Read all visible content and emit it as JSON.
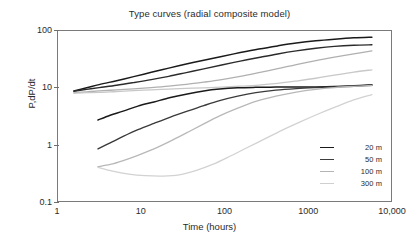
{
  "chart_data": {
    "type": "line",
    "title": "Type curves (radial composite model)",
    "xlabel": "Time (hours)",
    "ylabel": "P,dP/dt",
    "xscale": "log",
    "yscale": "log",
    "xlim": [
      1,
      10000
    ],
    "ylim": [
      0.1,
      100
    ],
    "grid": false,
    "legend_position": "lower-right",
    "xticks": [
      1,
      10,
      100,
      1000,
      10000
    ],
    "xtick_labels": [
      "1",
      "10",
      "100",
      "1000",
      "10,000"
    ],
    "yticks": [
      0.1,
      1,
      10,
      100
    ],
    "ytick_labels": [
      "0.1",
      "1",
      "10",
      "100"
    ],
    "legend": [
      {
        "label": "20 m",
        "color": "#1a1a1a"
      },
      {
        "label": "50 m",
        "color": "#3d3d3d"
      },
      {
        "label": "100 m",
        "color": "#b4b4b4"
      },
      {
        "label": "300 m",
        "color": "#cfcfcf"
      }
    ],
    "series": [
      {
        "name": "20 m pressure",
        "legend_group": "20 m",
        "color": "#1a1a1a",
        "width": 1.5,
        "points": [
          [
            1.55,
            9.0
          ],
          [
            2.2,
            10.2
          ],
          [
            3.1,
            11.6
          ],
          [
            5.0,
            13.6
          ],
          [
            8.0,
            16.0
          ],
          [
            13.0,
            19.0
          ],
          [
            21.0,
            22.5
          ],
          [
            34.0,
            26.5
          ],
          [
            55.0,
            31.0
          ],
          [
            90.0,
            36.0
          ],
          [
            150.0,
            42.0
          ],
          [
            250.0,
            48.5
          ],
          [
            420.0,
            55.0
          ],
          [
            700.0,
            61.5
          ],
          [
            1200.0,
            67.5
          ],
          [
            2000.0,
            72.0
          ],
          [
            3400.0,
            76.0
          ],
          [
            5600.0,
            78.0
          ]
        ]
      },
      {
        "name": "50 m pressure",
        "legend_group": "50 m",
        "color": "#2b2b2b",
        "width": 1.4,
        "points": [
          [
            1.55,
            8.9
          ],
          [
            2.2,
            9.6
          ],
          [
            3.1,
            10.3
          ],
          [
            5.0,
            11.3
          ],
          [
            8.0,
            12.6
          ],
          [
            13.0,
            14.2
          ],
          [
            21.0,
            16.2
          ],
          [
            34.0,
            18.8
          ],
          [
            55.0,
            21.8
          ],
          [
            90.0,
            25.5
          ],
          [
            150.0,
            29.8
          ],
          [
            250.0,
            34.5
          ],
          [
            420.0,
            39.8
          ],
          [
            700.0,
            45.0
          ],
          [
            1200.0,
            50.0
          ],
          [
            2000.0,
            54.0
          ],
          [
            3400.0,
            56.5
          ],
          [
            5600.0,
            57.5
          ]
        ]
      },
      {
        "name": "100 m pressure",
        "legend_group": "100 m",
        "color": "#b0b0b0",
        "width": 1.3,
        "points": [
          [
            1.55,
            8.4
          ],
          [
            2.2,
            8.7
          ],
          [
            3.1,
            9.0
          ],
          [
            5.0,
            9.4
          ],
          [
            8.0,
            9.8
          ],
          [
            13.0,
            10.3
          ],
          [
            21.0,
            10.9
          ],
          [
            34.0,
            11.7
          ],
          [
            55.0,
            12.8
          ],
          [
            90.0,
            14.2
          ],
          [
            150.0,
            16.2
          ],
          [
            250.0,
            18.8
          ],
          [
            420.0,
            22.0
          ],
          [
            700.0,
            26.0
          ],
          [
            1200.0,
            30.5
          ],
          [
            2000.0,
            35.0
          ],
          [
            3400.0,
            40.0
          ],
          [
            5600.0,
            45.0
          ]
        ]
      },
      {
        "name": "300 m pressure",
        "legend_group": "300 m",
        "color": "#c8c8c8",
        "width": 1.3,
        "points": [
          [
            1.55,
            8.2
          ],
          [
            2.2,
            8.4
          ],
          [
            3.1,
            8.5
          ],
          [
            5.0,
            8.8
          ],
          [
            8.0,
            9.1
          ],
          [
            13.0,
            9.4
          ],
          [
            21.0,
            9.7
          ],
          [
            34.0,
            10.0
          ],
          [
            55.0,
            10.2
          ],
          [
            90.0,
            10.5
          ],
          [
            150.0,
            10.9
          ],
          [
            250.0,
            11.4
          ],
          [
            420.0,
            12.2
          ],
          [
            700.0,
            13.4
          ],
          [
            1200.0,
            15.0
          ],
          [
            2000.0,
            17.0
          ],
          [
            3400.0,
            19.2
          ],
          [
            5600.0,
            21.0
          ]
        ]
      },
      {
        "name": "20 m derivative",
        "legend_group": "20 m",
        "color": "#1a1a1a",
        "width": 1.5,
        "points": [
          [
            3.0,
            2.8
          ],
          [
            4.2,
            3.4
          ],
          [
            6.0,
            4.0
          ],
          [
            9.0,
            4.9
          ],
          [
            14.0,
            5.8
          ],
          [
            22.0,
            6.9
          ],
          [
            35.0,
            8.0
          ],
          [
            55.0,
            9.0
          ],
          [
            85.0,
            9.7
          ],
          [
            140.0,
            10.2
          ],
          [
            230.0,
            10.4
          ],
          [
            400.0,
            10.5
          ],
          [
            700.0,
            10.5
          ],
          [
            1200.0,
            10.6
          ],
          [
            2000.0,
            10.8
          ],
          [
            3400.0,
            11.1
          ],
          [
            5600.0,
            11.5
          ]
        ]
      },
      {
        "name": "50 m derivative",
        "legend_group": "50 m",
        "color": "#3a3a3a",
        "width": 1.4,
        "points": [
          [
            3.0,
            0.88
          ],
          [
            4.2,
            1.12
          ],
          [
            6.0,
            1.45
          ],
          [
            9.0,
            1.9
          ],
          [
            14.0,
            2.45
          ],
          [
            22.0,
            3.15
          ],
          [
            35.0,
            4.0
          ],
          [
            55.0,
            5.0
          ],
          [
            85.0,
            6.1
          ],
          [
            140.0,
            7.3
          ],
          [
            230.0,
            8.4
          ],
          [
            400.0,
            9.3
          ],
          [
            700.0,
            9.9
          ],
          [
            1200.0,
            10.3
          ],
          [
            2000.0,
            10.6
          ],
          [
            3400.0,
            10.9
          ],
          [
            5600.0,
            11.3
          ]
        ]
      },
      {
        "name": "100 m derivative",
        "legend_group": "100 m",
        "color": "#b8b8b8",
        "width": 1.3,
        "points": [
          [
            3.0,
            0.43
          ],
          [
            4.2,
            0.47
          ],
          [
            6.0,
            0.55
          ],
          [
            9.0,
            0.68
          ],
          [
            14.0,
            0.88
          ],
          [
            22.0,
            1.2
          ],
          [
            35.0,
            1.7
          ],
          [
            55.0,
            2.4
          ],
          [
            85.0,
            3.3
          ],
          [
            140.0,
            4.5
          ],
          [
            230.0,
            5.9
          ],
          [
            400.0,
            7.3
          ],
          [
            700.0,
            8.6
          ],
          [
            1200.0,
            9.6
          ],
          [
            2000.0,
            10.3
          ],
          [
            3400.0,
            10.8
          ],
          [
            5600.0,
            11.2
          ]
        ]
      },
      {
        "name": "300 m derivative",
        "legend_group": "300 m",
        "color": "#d2d2d2",
        "width": 1.3,
        "points": [
          [
            3.0,
            0.42
          ],
          [
            4.5,
            0.36
          ],
          [
            7.0,
            0.32
          ],
          [
            11.0,
            0.3
          ],
          [
            18.0,
            0.295
          ],
          [
            28.0,
            0.31
          ],
          [
            45.0,
            0.37
          ],
          [
            70.0,
            0.47
          ],
          [
            110.0,
            0.64
          ],
          [
            180.0,
            0.92
          ],
          [
            290.0,
            1.3
          ],
          [
            470.0,
            1.85
          ],
          [
            780.0,
            2.6
          ],
          [
            1300.0,
            3.6
          ],
          [
            2100.0,
            4.8
          ],
          [
            3400.0,
            6.3
          ],
          [
            5600.0,
            7.8
          ]
        ]
      }
    ]
  }
}
